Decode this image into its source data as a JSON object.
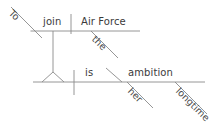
{
  "diagram": {
    "type": "sentence-diagram",
    "style": "reed-kellogg",
    "sentence": "To join the Air Force is her longtime ambition.",
    "stroke_color": "#8a8a8a",
    "text_color": "#3a3a3a",
    "background_color": "#ffffff",
    "upper_clause": {
      "subject": "To",
      "verb": "join",
      "object": "Air Force",
      "object_modifier": "the"
    },
    "lower_clause": {
      "verb": "is",
      "complement": "ambition",
      "complement_modifier_1": "her",
      "complement_modifier_2": "longtime"
    },
    "words": {
      "to": "To",
      "join": "join",
      "air_force": "Air Force",
      "the": "the",
      "is": "is",
      "ambition": "ambition",
      "her": "her",
      "longtime": "longtime"
    }
  }
}
